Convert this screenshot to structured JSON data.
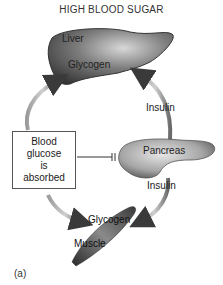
{
  "title": "HIGH BLOOD SUGAR",
  "liver": {
    "name": "Liver",
    "store": "Glycogen"
  },
  "pancreas": {
    "name": "Pancreas"
  },
  "muscle": {
    "name": "Muscle",
    "store": "Glycogen"
  },
  "hormone_labels": {
    "upper": "Insulin",
    "lower": "Insulin"
  },
  "box": {
    "line1": "Blood",
    "line2": "glucose",
    "line3": "is",
    "line4": "absorbed"
  },
  "figure_label": "(a)",
  "colors": {
    "organ_dark": "#3a3a3a",
    "organ_mid": "#7a7a7a",
    "arrow": "#4a4a4a",
    "box_border": "#555555"
  }
}
